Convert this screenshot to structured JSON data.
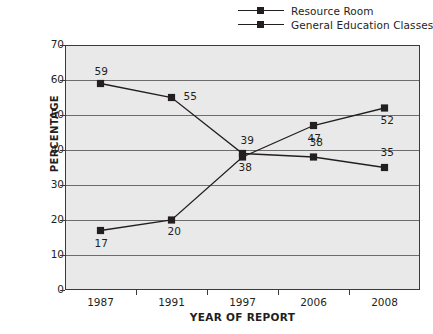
{
  "chart_data": {
    "type": "line",
    "title": "",
    "xlabel": "YEAR OF REPORT",
    "ylabel": "PERCENTAGE",
    "categories": [
      "1987",
      "1991",
      "1997",
      "2006",
      "2008"
    ],
    "ylim": [
      0,
      70
    ],
    "yticks": [
      0,
      10,
      20,
      30,
      40,
      50,
      60,
      70
    ],
    "grid": true,
    "legend_position": "top-right",
    "series": [
      {
        "name": "Resource Room",
        "values": [
          59,
          55,
          39,
          38,
          35
        ],
        "point_labels": [
          "59",
          "55",
          "39",
          "38",
          "35"
        ]
      },
      {
        "name": "General Education Classes",
        "values": [
          17,
          20,
          38,
          47,
          52
        ],
        "point_labels": [
          "17",
          "20",
          "38",
          "47",
          "52"
        ]
      }
    ],
    "colors": {
      "series_line": "#231f20",
      "plot_background": "#e9e9e9",
      "gridline": "#6c6c6c",
      "frame": "#3a3a3a"
    }
  }
}
